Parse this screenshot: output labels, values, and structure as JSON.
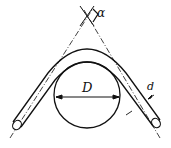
{
  "diagram": {
    "labels": {
      "angle": "α",
      "die_diameter": "D",
      "pipe_diameter": "d"
    },
    "colors": {
      "line": "#111111",
      "background": "#ffffff"
    }
  }
}
